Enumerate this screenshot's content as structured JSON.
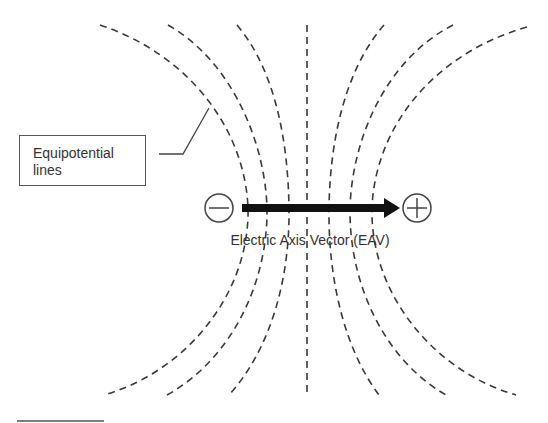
{
  "diagram": {
    "callout": {
      "line1": "Equipotential",
      "line2": "lines"
    },
    "axis_label": "Electric Axis Vector (EAV)",
    "negative_pole_symbol": "minus-circle",
    "positive_pole_symbol": "plus-circle",
    "colors": {
      "line": "#3a3a3a",
      "arrow": "#111111",
      "text": "#333333"
    }
  }
}
